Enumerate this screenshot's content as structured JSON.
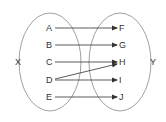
{
  "diagram": {
    "type": "mapping",
    "sets": [
      {
        "id": "X",
        "label": "X",
        "elements": [
          "A",
          "B",
          "C",
          "D",
          "E"
        ]
      },
      {
        "id": "Y",
        "label": "Y",
        "elements": [
          "F",
          "G",
          "H",
          "I",
          "J"
        ]
      }
    ],
    "arrows": [
      {
        "from": "A",
        "to": "F"
      },
      {
        "from": "B",
        "to": "G"
      },
      {
        "from": "C",
        "to": "H"
      },
      {
        "from": "D",
        "to": "H"
      },
      {
        "from": "D",
        "to": "I"
      },
      {
        "from": "E",
        "to": "J"
      }
    ],
    "colors": {
      "stroke": "#333333",
      "ellipse": "#888888"
    }
  }
}
